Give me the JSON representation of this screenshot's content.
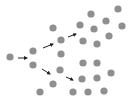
{
  "diagram": {
    "colors": {
      "background": "#ffffff",
      "dot": "#8f8f8f",
      "arrow": "#222222"
    },
    "dot_radius": 3.6,
    "dots": [
      {
        "x": 10,
        "y": 57
      },
      {
        "x": 33,
        "y": 51
      },
      {
        "x": 33,
        "y": 65
      },
      {
        "x": 53,
        "y": 28
      },
      {
        "x": 61,
        "y": 40
      },
      {
        "x": 61,
        "y": 54
      },
      {
        "x": 60,
        "y": 70
      },
      {
        "x": 53,
        "y": 84
      },
      {
        "x": 40,
        "y": 92
      },
      {
        "x": 80,
        "y": 25
      },
      {
        "x": 91,
        "y": 14
      },
      {
        "x": 118,
        "y": 9
      },
      {
        "x": 106,
        "y": 21
      },
      {
        "x": 94,
        "y": 29
      },
      {
        "x": 122,
        "y": 26
      },
      {
        "x": 83,
        "y": 41
      },
      {
        "x": 97,
        "y": 44
      },
      {
        "x": 109,
        "y": 36
      },
      {
        "x": 83,
        "y": 63
      },
      {
        "x": 97,
        "y": 63
      },
      {
        "x": 82,
        "y": 79
      },
      {
        "x": 97,
        "y": 78
      },
      {
        "x": 111,
        "y": 73
      },
      {
        "x": 73,
        "y": 92
      },
      {
        "x": 88,
        "y": 92
      },
      {
        "x": 104,
        "y": 91
      }
    ],
    "arrows": [
      {
        "x1": 18,
        "y1": 58,
        "x2": 27,
        "y2": 58
      },
      {
        "x1": 43,
        "y1": 48,
        "x2": 53,
        "y2": 44
      },
      {
        "x1": 68,
        "y1": 37,
        "x2": 76,
        "y2": 34
      },
      {
        "x1": 42,
        "y1": 69,
        "x2": 50,
        "y2": 74
      },
      {
        "x1": 66,
        "y1": 77,
        "x2": 73,
        "y2": 80
      }
    ]
  }
}
